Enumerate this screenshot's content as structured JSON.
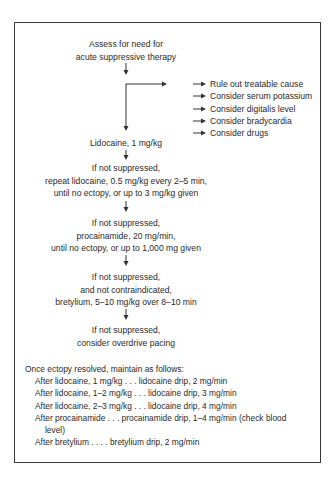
{
  "diagram": {
    "start": [
      "Assess for need for",
      "acute suppressive therapy"
    ],
    "side_checks": [
      "Rule out treatable cause",
      "Consider serum potassium",
      "Consider digitalis level",
      "Consider bradycardia",
      "Consider drugs"
    ],
    "steps": [
      {
        "lines": [
          "Lidocaine, 1 mg/kg"
        ]
      },
      {
        "lines": [
          "If not suppressed,",
          "repeat lidocaine, 0.5 mg/kg every 2–5 min,",
          "until no ectopy, or up to 3 mg/kg given"
        ]
      },
      {
        "lines": [
          "If not suppressed,",
          "procainamide, 20 mg/min,",
          "until no ectopy, or up to 1,000 mg given"
        ]
      },
      {
        "lines": [
          "If not suppressed,",
          "and not contraindicated,",
          "bretylium, 5–10 mg/kg over 8–10 min"
        ]
      },
      {
        "lines": [
          "If not suppressed,",
          "consider overdrive pacing"
        ]
      }
    ],
    "maintenance": {
      "heading": "Once ectopy resolved, maintain as follows:",
      "items": [
        "After lidocaine, 1 mg/kg . . . lidocaine drip, 2 mg/min",
        "After lidocaine, 1–2 mg/kg . . . lidocaine drip, 3 mg/min",
        "After lidocaine, 2–3 mg/kg . . . lidocaine drip, 4 mg/min",
        "After procainamide . . . procainamide drip, 1–4 mg/min (check blood level)",
        "After bretylium . . . . bretylium drip, 2 mg/min"
      ],
      "item4_line1": "After procainamide . . . procainamide drip, 1–4 mg/min (check blood",
      "item4_line2": "level)"
    }
  }
}
